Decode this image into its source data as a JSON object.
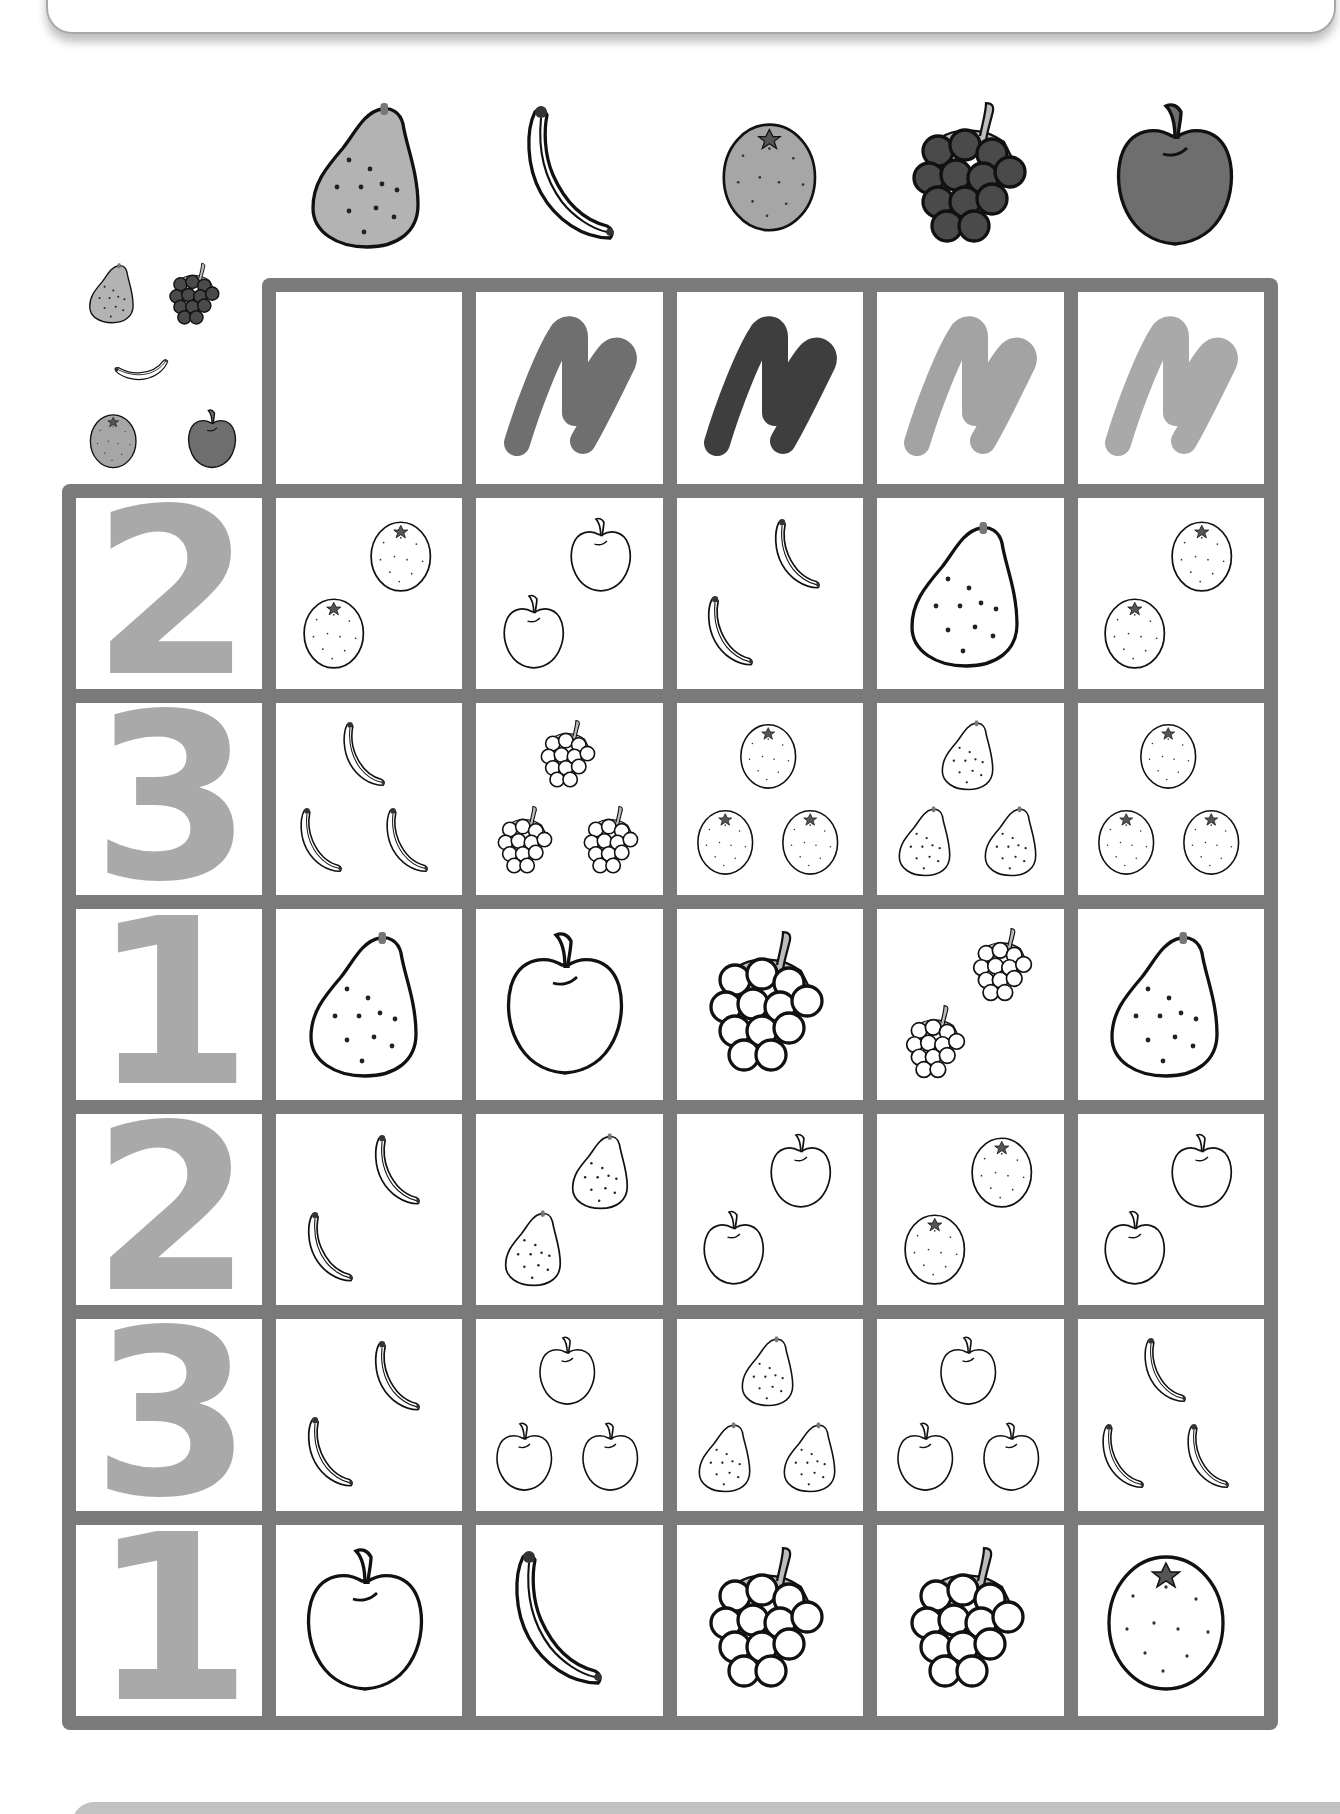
{
  "worksheet": {
    "title": "",
    "header_fruits": [
      {
        "name": "pear",
        "fill": "#b3b3b3"
      },
      {
        "name": "banana",
        "fill": "#ffffff"
      },
      {
        "name": "orange",
        "fill": "#a6a6a6"
      },
      {
        "name": "grapes",
        "fill": "#4a4a4a"
      },
      {
        "name": "apple",
        "fill": "#6e6e6e"
      }
    ],
    "legend_fruits": [
      "pear",
      "grapes",
      "banana",
      "orange",
      "apple"
    ],
    "crayon_marks": [
      {
        "column": 1,
        "color": "#6f6f6f"
      },
      {
        "column": 2,
        "color": "#3e3e3e"
      },
      {
        "column": 3,
        "color": "#a3a3a3"
      },
      {
        "column": 4,
        "color": "#a9a9a9"
      }
    ],
    "rows": [
      {
        "number": "2",
        "cells": [
          {
            "fruit": "orange",
            "count": 2
          },
          {
            "fruit": "apple",
            "count": 2
          },
          {
            "fruit": "banana",
            "count": 2
          },
          {
            "fruit": "pear",
            "count": 1
          },
          {
            "fruit": "orange",
            "count": 2
          }
        ]
      },
      {
        "number": "3",
        "cells": [
          {
            "fruit": "banana",
            "count": 3
          },
          {
            "fruit": "grapes",
            "count": 3
          },
          {
            "fruit": "orange",
            "count": 3
          },
          {
            "fruit": "pear",
            "count": 3
          },
          {
            "fruit": "orange",
            "count": 3
          }
        ]
      },
      {
        "number": "1",
        "cells": [
          {
            "fruit": "pear",
            "count": 1
          },
          {
            "fruit": "apple",
            "count": 1
          },
          {
            "fruit": "grapes",
            "count": 1
          },
          {
            "fruit": "grapes",
            "count": 2
          },
          {
            "fruit": "pear",
            "count": 1
          }
        ]
      },
      {
        "number": "2",
        "cells": [
          {
            "fruit": "banana",
            "count": 2
          },
          {
            "fruit": "pear",
            "count": 2
          },
          {
            "fruit": "apple",
            "count": 2
          },
          {
            "fruit": "orange",
            "count": 2
          },
          {
            "fruit": "apple",
            "count": 2
          }
        ]
      },
      {
        "number": "3",
        "cells": [
          {
            "fruit": "banana",
            "count": 2
          },
          {
            "fruit": "apple",
            "count": 3
          },
          {
            "fruit": "pear",
            "count": 3
          },
          {
            "fruit": "apple",
            "count": 3
          },
          {
            "fruit": "banana",
            "count": 3
          }
        ]
      },
      {
        "number": "1",
        "cells": [
          {
            "fruit": "apple",
            "count": 1
          },
          {
            "fruit": "banana",
            "count": 1
          },
          {
            "fruit": "grapes",
            "count": 1
          },
          {
            "fruit": "grapes",
            "count": 1
          },
          {
            "fruit": "orange",
            "count": 1
          }
        ]
      }
    ],
    "colors": {
      "grid_border": "#7a7a7a",
      "number_fill": "#a9a9a9",
      "grape_stem": "#bdbdbd"
    }
  }
}
